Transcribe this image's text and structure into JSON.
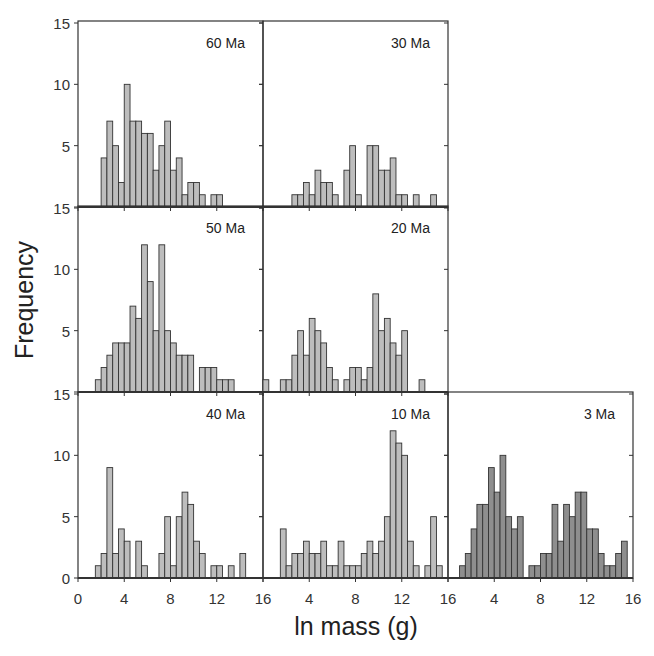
{
  "chart_data": {
    "type": "bar",
    "subtype": "histogram-panel-grid",
    "xlabel": "ln mass (g)",
    "ylabel": "Frequency",
    "bin_width": 0.5,
    "xlim": [
      0,
      16
    ],
    "ylim": [
      0,
      15
    ],
    "x_ticks": [
      0,
      4,
      8,
      12,
      16
    ],
    "y_ticks": [
      0,
      5,
      10,
      15
    ],
    "grid": false,
    "legend": null,
    "panels": [
      {
        "label": "60 Ma",
        "row": 0,
        "col": 0,
        "bin_start": 2.0,
        "fill": "#bdbdbd",
        "values": [
          4,
          7,
          5,
          2,
          10,
          7,
          7,
          6,
          6,
          3,
          5,
          7,
          3,
          4,
          1,
          2,
          2,
          1,
          0,
          1,
          1
        ]
      },
      {
        "label": "30 Ma",
        "row": 0,
        "col": 1,
        "bin_start": 2.5,
        "fill": "#bdbdbd",
        "values": [
          1,
          1,
          2,
          1,
          3,
          2,
          2,
          1,
          0,
          3,
          5,
          1,
          0,
          5,
          5,
          3,
          3,
          4,
          1,
          1,
          0,
          1,
          0,
          0,
          1
        ]
      },
      {
        "label": "50 Ma",
        "row": 1,
        "col": 0,
        "bin_start": 1.5,
        "fill": "#bdbdbd",
        "values": [
          1,
          2,
          3,
          4,
          4,
          4,
          7,
          6,
          12,
          9,
          5,
          12,
          5,
          4,
          3,
          3,
          3,
          0,
          2,
          2,
          2,
          1,
          1,
          1
        ]
      },
      {
        "label": "20 Ma",
        "row": 1,
        "col": 1,
        "bin_start": 0.0,
        "fill": "#bdbdbd",
        "values": [
          1,
          0,
          0,
          1,
          1,
          3,
          5,
          3,
          6,
          5,
          4,
          2,
          1,
          0,
          1,
          2,
          2,
          1,
          2,
          8,
          5,
          6,
          4,
          3,
          5,
          0,
          0,
          1
        ]
      },
      {
        "label": "40 Ma",
        "row": 2,
        "col": 0,
        "bin_start": 1.5,
        "fill": "#bdbdbd",
        "values": [
          1,
          2,
          9,
          2,
          4,
          3,
          0,
          3,
          1,
          0,
          0,
          2,
          5,
          1,
          5,
          7,
          6,
          3,
          2,
          0,
          1,
          1,
          0,
          1,
          0,
          2
        ]
      },
      {
        "label": "10 Ma",
        "row": 2,
        "col": 1,
        "bin_start": 1.5,
        "fill": "#bdbdbd",
        "values": [
          4,
          1,
          2,
          2,
          3,
          2,
          2,
          3,
          1,
          1,
          3,
          1,
          1,
          1,
          2,
          3,
          2,
          3,
          5,
          12,
          11,
          10,
          3,
          1,
          0,
          1,
          5,
          1
        ]
      },
      {
        "label": "3 Ma",
        "row": 2,
        "col": 2,
        "bin_start": 1.0,
        "fill": "#8e8e8e",
        "values": [
          1,
          2,
          4,
          6,
          6,
          9,
          7,
          10,
          5,
          4,
          5,
          0,
          1,
          1,
          2,
          2,
          6,
          3,
          6,
          5,
          7,
          7,
          4,
          4,
          2,
          1,
          1,
          2,
          3
        ]
      }
    ],
    "row_y_tick_labels": [
      [
        "15",
        "10",
        "5",
        ""
      ],
      [
        "15",
        "10",
        "5",
        ""
      ],
      [
        "15",
        "10",
        "5",
        "0"
      ]
    ],
    "bottom_x_tick_labels": [
      [
        "0",
        "4",
        "8",
        "12",
        "16"
      ],
      [
        "",
        "4",
        "8",
        "12",
        "16"
      ],
      [
        "",
        "4",
        "8",
        "12",
        "16"
      ]
    ]
  },
  "colors": {
    "axis": "#333333",
    "bar_stroke": "#333333",
    "light_bar": "#bdbdbd",
    "dark_bar": "#8e8e8e",
    "background": "#ffffff"
  }
}
